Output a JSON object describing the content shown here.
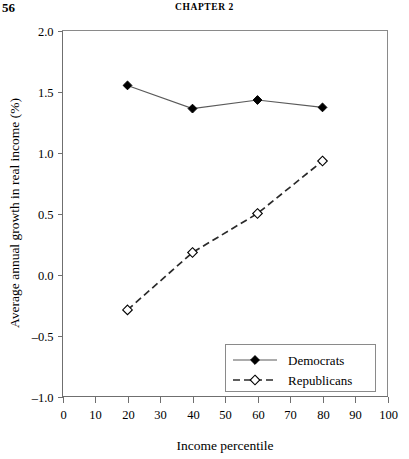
{
  "page": {
    "folio": "56",
    "running_head": "CHAPTER 2"
  },
  "chart_data": {
    "type": "line",
    "title": "",
    "xlabel": "Income percentile",
    "ylabel": "Average annual growth in real income (%)",
    "xlim": [
      0,
      100
    ],
    "ylim": [
      -1.0,
      2.0
    ],
    "xticks": [
      "0",
      "10",
      "20",
      "30",
      "40",
      "50",
      "60",
      "70",
      "80",
      "90",
      "100"
    ],
    "xtick_values": [
      0,
      10,
      20,
      30,
      40,
      50,
      60,
      70,
      80,
      90,
      100
    ],
    "yticks": [
      "2.0",
      "1.5",
      "1.0",
      "0.5",
      "0.0",
      "-0.5",
      "-1.0"
    ],
    "ytick_values": [
      2.0,
      1.5,
      1.0,
      0.5,
      0.0,
      -0.5,
      -1.0
    ],
    "grid": false,
    "legend_position": "lower-right",
    "x": [
      20,
      40,
      60,
      80
    ],
    "series": [
      {
        "name": "Democrats",
        "values": [
          1.55,
          1.36,
          1.43,
          1.37
        ],
        "line_style": "solid",
        "marker": "filled-diamond",
        "color": "#000000"
      },
      {
        "name": "Republicans",
        "values": [
          -0.29,
          0.18,
          0.5,
          0.93
        ],
        "line_style": "dashed",
        "marker": "open-diamond",
        "color": "#000000"
      }
    ]
  },
  "legend": {
    "entries": [
      {
        "label": "Democrats"
      },
      {
        "label": "Republicans"
      }
    ]
  }
}
